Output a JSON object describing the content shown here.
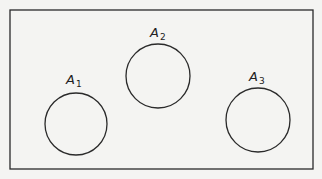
{
  "diagram": {
    "type": "venn",
    "universe": {
      "x": 10,
      "y": 10,
      "width": 303,
      "height": 159
    },
    "sets": [
      {
        "name": "A",
        "subscript": "1",
        "cx": 76,
        "cy": 124,
        "r": 31,
        "label_x": 66,
        "label_y": 84
      },
      {
        "name": "A",
        "subscript": "2",
        "cx": 158,
        "cy": 76,
        "r": 32,
        "label_x": 150,
        "label_y": 37
      },
      {
        "name": "A",
        "subscript": "3",
        "cx": 258,
        "cy": 120,
        "r": 32,
        "label_x": 249,
        "label_y": 81
      }
    ],
    "stroke_color": "#2a2a2a",
    "background": "#f4f4f2"
  }
}
